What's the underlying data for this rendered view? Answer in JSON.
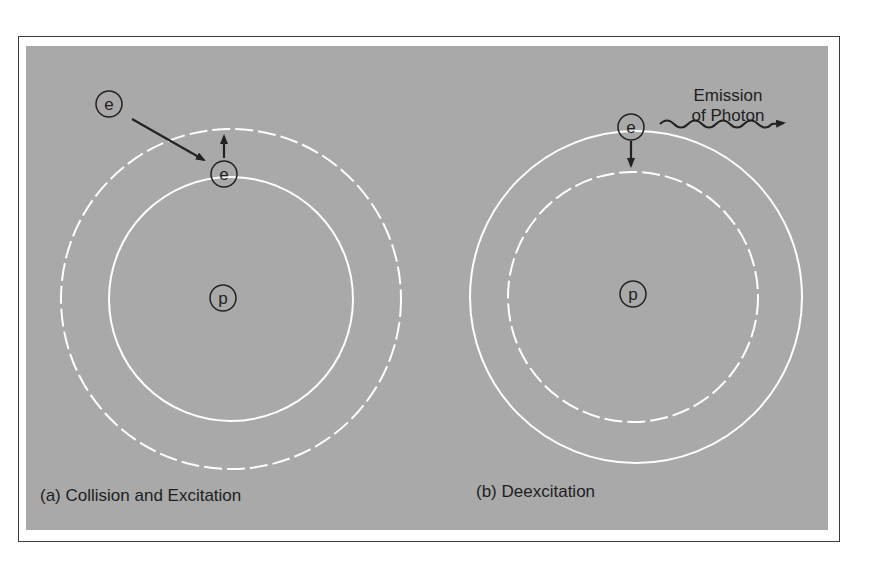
{
  "figure": {
    "panel_a": {
      "caption": "(a) Collision and Excitation",
      "incoming_particle": "e",
      "orbit_particle": "e",
      "nucleus": "p",
      "inner_orbit": "solid",
      "outer_orbit": "dashed"
    },
    "panel_b": {
      "caption": "(b) Deexcitation",
      "orbit_particle": "e",
      "nucleus": "p",
      "inner_orbit": "dashed",
      "outer_orbit": "solid",
      "emission_label_line1": "Emission",
      "emission_label_line2": "of Photon"
    },
    "colors": {
      "background_panel": "#a9a9a9",
      "orbit": "#ffffff",
      "ink": "#222222"
    }
  }
}
